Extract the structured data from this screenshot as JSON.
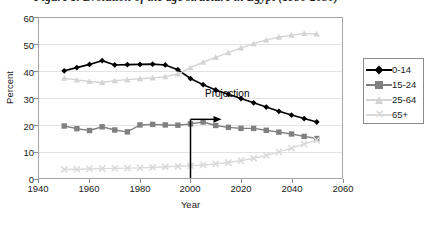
{
  "figure": {
    "title": "Figure 1.   Evolution of the age structure in Egypt (1950-2050)"
  },
  "chart_data": {
    "type": "line",
    "title": "Figure 1.   Evolution of the age structure in Egypt (1950-2050)",
    "xlabel": "Year",
    "ylabel": "Percent",
    "xlim": [
      1940,
      2060
    ],
    "ylim": [
      0,
      60
    ],
    "xticks": [
      1940,
      1960,
      1980,
      2000,
      2020,
      2040,
      2060
    ],
    "yticks": [
      0,
      10,
      20,
      30,
      40,
      50,
      60
    ],
    "grid": "horizontal",
    "legend_position": "right-outside",
    "x": [
      1950,
      1955,
      1960,
      1965,
      1970,
      1975,
      1980,
      1985,
      1990,
      1995,
      2000,
      2005,
      2010,
      2015,
      2020,
      2025,
      2030,
      2035,
      2040,
      2045,
      2050
    ],
    "series": [
      {
        "name": "0-14",
        "color": "#000000",
        "marker": "diamond",
        "values": [
          40.2,
          41.4,
          42.6,
          44.0,
          42.4,
          42.5,
          42.6,
          42.7,
          42.4,
          40.6,
          37.3,
          35.0,
          33.0,
          31.4,
          29.8,
          28.2,
          26.6,
          25.0,
          23.6,
          22.3,
          21.0
        ]
      },
      {
        "name": "15-24",
        "color": "#808080",
        "marker": "square",
        "values": [
          19.5,
          18.5,
          17.8,
          19.2,
          18.0,
          17.3,
          19.9,
          20.1,
          19.9,
          19.8,
          20.3,
          21.0,
          19.7,
          19.0,
          18.6,
          18.6,
          17.9,
          17.2,
          16.5,
          15.6,
          14.8
        ]
      },
      {
        "name": "25-64",
        "color": "#d4d4d4",
        "marker": "triangle",
        "values": [
          37.4,
          36.8,
          36.2,
          35.8,
          36.5,
          36.9,
          37.2,
          37.5,
          38.0,
          39.0,
          41.4,
          43.4,
          45.2,
          47.0,
          48.8,
          50.4,
          51.8,
          52.8,
          53.6,
          54.2,
          54.0
        ]
      },
      {
        "name": "65+",
        "color": "#d9d9d9",
        "marker": "x",
        "values": [
          3.2,
          3.3,
          3.4,
          3.5,
          3.6,
          3.7,
          3.8,
          4.0,
          4.2,
          4.4,
          4.6,
          4.9,
          5.3,
          5.8,
          6.5,
          7.4,
          8.5,
          9.8,
          11.2,
          12.7,
          14.2
        ]
      }
    ],
    "annotations": [
      {
        "label": "Projection",
        "type": "vertical-line-with-arrow",
        "x": 2000,
        "y_top": 22,
        "arrow_direction": "right"
      }
    ]
  },
  "yaxis": {
    "title": "Percent",
    "ticks": [
      "60",
      "50",
      "40",
      "30",
      "20",
      "10",
      "0"
    ]
  },
  "xaxis": {
    "title": "Year",
    "ticks": [
      "1940",
      "1960",
      "1980",
      "2000",
      "2020",
      "2040",
      "2060"
    ]
  },
  "annotation": {
    "projection_label": "Projection"
  },
  "legend": {
    "items": [
      {
        "label": "0-14",
        "color": "#000000",
        "marker": "diamond"
      },
      {
        "label": "15-24",
        "color": "#808080",
        "marker": "square"
      },
      {
        "label": "25-64",
        "color": "#d4d4d4",
        "marker": "triangle"
      },
      {
        "label": "65+",
        "color": "#d9d9d9",
        "marker": "x"
      }
    ]
  }
}
